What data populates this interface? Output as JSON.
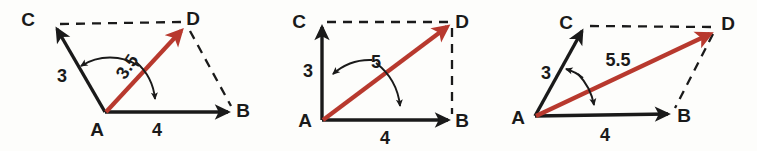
{
  "figure": {
    "colors": {
      "resultant": "#b8392e",
      "ink": "#1a1a1a",
      "background": "#fdfdfb"
    }
  },
  "diagrams": [
    {
      "id": "diagram-1",
      "shape": "oblique-parallelogram-acute",
      "points": {
        "A": {
          "label": "A",
          "x": 105,
          "y": 112,
          "label_x": 97,
          "label_y": 136
        },
        "B": {
          "label": "B",
          "x": 233,
          "y": 112,
          "label_x": 241,
          "label_y": 117
        },
        "C": {
          "label": "C",
          "x": 55,
          "y": 26,
          "label_x": 28,
          "label_y": 26
        },
        "D": {
          "label": "D",
          "x": 185,
          "y": 25,
          "label_x": 193,
          "label_y": 25
        }
      },
      "magnitudes": {
        "side_ac": {
          "value": "3",
          "x": 62,
          "y": 82,
          "rotate": 0
        },
        "side_ab": {
          "value": "4",
          "x": 157,
          "y": 136,
          "rotate": 0
        },
        "resultant": {
          "value": "3.5",
          "x": 132,
          "y": 70,
          "rotate": -56
        }
      }
    },
    {
      "id": "diagram-2",
      "shape": "rectangle-right-angle",
      "points": {
        "A": {
          "label": "A",
          "x": 322,
          "y": 120,
          "label_x": 306,
          "label_y": 125
        },
        "B": {
          "label": "B",
          "x": 452,
          "y": 120,
          "label_x": 460,
          "label_y": 125
        },
        "C": {
          "label": "C",
          "x": 322,
          "y": 22,
          "label_x": 299,
          "label_y": 25
        },
        "D": {
          "label": "D",
          "x": 452,
          "y": 22,
          "label_x": 460,
          "label_y": 25
        }
      },
      "magnitudes": {
        "side_ac": {
          "value": "3",
          "x": 308,
          "y": 77,
          "rotate": 0
        },
        "side_ab": {
          "value": "4",
          "x": 385,
          "y": 144,
          "rotate": 0
        },
        "resultant": {
          "value": "5",
          "x": 376,
          "y": 68,
          "rotate": 0
        }
      }
    },
    {
      "id": "diagram-3",
      "shape": "oblique-parallelogram-obtuse",
      "points": {
        "A": {
          "label": "A",
          "x": 535,
          "y": 116,
          "label_x": 519,
          "label_y": 122
        },
        "B": {
          "label": "B",
          "x": 672,
          "y": 113,
          "label_x": 682,
          "label_y": 121
        },
        "C": {
          "label": "C",
          "x": 585,
          "y": 27,
          "label_x": 566,
          "label_y": 27
        },
        "D": {
          "label": "D",
          "x": 715,
          "y": 28,
          "label_x": 726,
          "label_y": 28
        }
      },
      "magnitudes": {
        "side_ac": {
          "value": "3",
          "x": 546,
          "y": 77,
          "rotate": 0
        },
        "side_ab": {
          "value": "4",
          "x": 605,
          "y": 141,
          "rotate": 0
        },
        "resultant": {
          "value": "5.5",
          "x": 616,
          "y": 65,
          "rotate": 0
        }
      }
    }
  ]
}
